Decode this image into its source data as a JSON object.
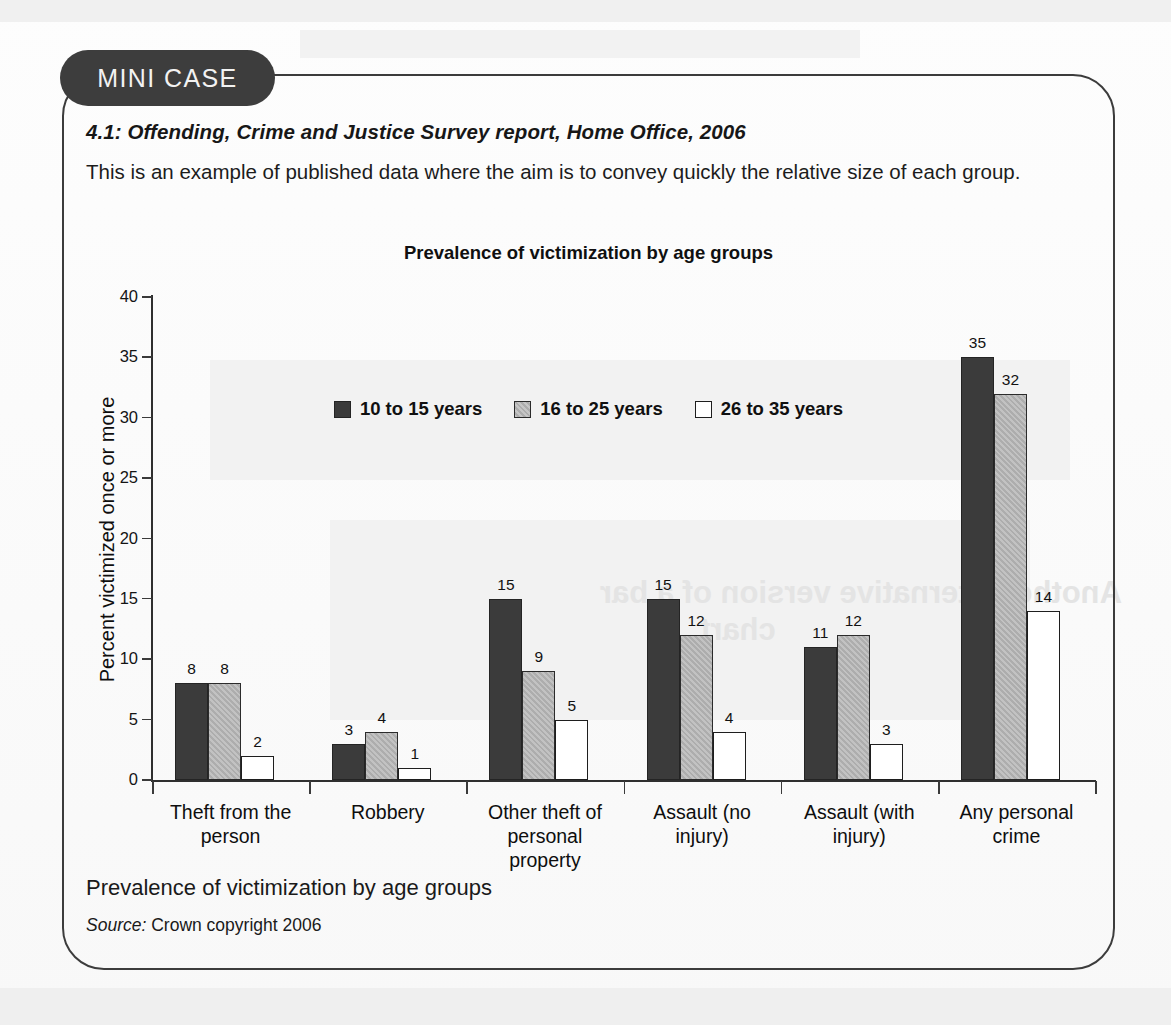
{
  "panel": {
    "badge": "MINI CASE",
    "case_title": "4.1: Offending, Crime and Justice Survey report, Home Office, 2006",
    "case_body": "This is an example of published data where the aim is to convey quickly the relative size of each group.",
    "caption": "Prevalence of victimization by age groups",
    "source_label": "Source:",
    "source_text": "Crown copyright 2006"
  },
  "colors": {
    "series_0": "#3b3b3b",
    "series_1": "#adadad",
    "series_2": "#ffffff",
    "outline": "#1e1e1e",
    "badge_bg": "#3d3d3d",
    "panel_border": "#3c3c3c"
  },
  "chart_data": {
    "type": "bar",
    "title": "Prevalence of victimization by age groups",
    "xlabel": "",
    "ylabel": "Percent victimized once or more",
    "ylim": [
      0,
      40
    ],
    "yticks": [
      0,
      5,
      10,
      15,
      20,
      25,
      30,
      35,
      40
    ],
    "grid": false,
    "legend_position": "upper-center-inside",
    "categories": [
      "Theft from the person",
      "Robbery",
      "Other theft of personal property",
      "Assault (no injury)",
      "Assault (with injury)",
      "Any personal crime"
    ],
    "category_lines": [
      [
        "Theft from the",
        "person"
      ],
      [
        "Robbery"
      ],
      [
        "Other theft of",
        "personal",
        "property"
      ],
      [
        "Assault (no",
        "injury)"
      ],
      [
        "Assault (with",
        "injury)"
      ],
      [
        "Any personal",
        "crime"
      ]
    ],
    "series": [
      {
        "name": "10 to 15 years",
        "values": [
          8,
          3,
          15,
          15,
          11,
          35
        ]
      },
      {
        "name": "16 to 25 years",
        "values": [
          8,
          4,
          9,
          12,
          12,
          32
        ]
      },
      {
        "name": "26 to 35 years",
        "values": [
          2,
          1,
          5,
          4,
          3,
          14
        ]
      }
    ]
  }
}
